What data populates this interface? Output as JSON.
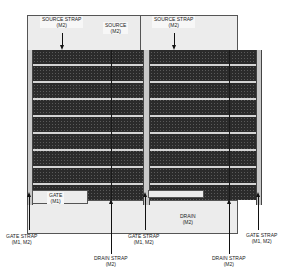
{
  "diagram": {
    "type": "transistor-layout",
    "labels": {
      "source_strap_left": {
        "line1": "SOURCE STRAP",
        "line2": "(M2)"
      },
      "source": {
        "line1": "SOURCE",
        "line2": "(M2)"
      },
      "source_strap_right": {
        "line1": "SOURCE STRAP",
        "line2": "(M2)"
      },
      "gate": {
        "line1": "GATE",
        "line2": "(M1)"
      },
      "drain": {
        "line1": "DRAIN",
        "line2": "(M2)"
      },
      "gate_strap_left": {
        "line1": "GATE STRAP",
        "line2": "(M1, M2)"
      },
      "drain_strap_left": {
        "line1": "DRAIN STRAP",
        "line2": "(M2)"
      },
      "gate_strap_center": {
        "line1": "GATE STRAP",
        "line2": "(M1, M2)"
      },
      "drain_strap_right": {
        "line1": "DRAIN STRAP",
        "line2": "(M2)"
      },
      "gate_strap_right": {
        "line1": "GATE STRAP",
        "line2": "(M1, M2)"
      }
    },
    "finger_rows": 10,
    "colors": {
      "source_fill": "#ececec",
      "active_fill": "#2b2b2b",
      "stripe": "#d4d4d4",
      "line": "#111111"
    }
  }
}
